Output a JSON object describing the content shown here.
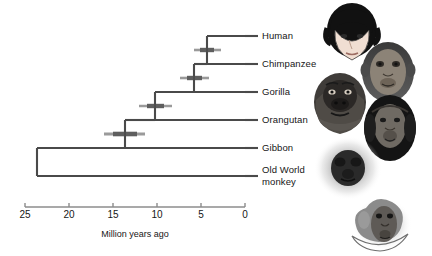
{
  "figure": {
    "type": "phylogenetic-tree",
    "axis_title": "Million years ago",
    "axis": {
      "ticks": [
        25,
        20,
        15,
        10,
        5,
        0
      ],
      "tick_labels": [
        "25",
        "20",
        "15",
        "10",
        "5",
        "0"
      ],
      "min": 0,
      "max": 25,
      "direction": "right-to-left",
      "x_left_px": 25,
      "x_right_px": 245
    },
    "colors": {
      "branch": "#4a4a4a",
      "axis": "#8c8c8c",
      "error_bar": "#8e8e8e",
      "error_bar_core": "#5a5a5a",
      "text": "#161616",
      "background": "#ffffff"
    },
    "tips": [
      {
        "id": "human",
        "label": "Human",
        "row": 0,
        "y_px": 36
      },
      {
        "id": "chimpanzee",
        "label": "Chimpanzee",
        "row": 1,
        "y_px": 64
      },
      {
        "id": "gorilla",
        "label": "Gorilla",
        "row": 2,
        "y_px": 92
      },
      {
        "id": "orangutan",
        "label": "Orangutan",
        "row": 3,
        "y_px": 120
      },
      {
        "id": "gibbon",
        "label": "Gibbon",
        "row": 4,
        "y_px": 148
      },
      {
        "id": "old-world-monkey",
        "label": "Old World",
        "label2": "monkey",
        "row": 5,
        "y_px": 176
      }
    ],
    "nodes": [
      {
        "id": "human-chimp",
        "age_mya": 6.0,
        "x_px": 207,
        "y_px": 50,
        "children": [
          "human",
          "chimpanzee"
        ],
        "ci_low_mya": 7.4,
        "ci_high_mya": 4.6
      },
      {
        "id": "hc-gorilla",
        "age_mya": 7.1,
        "x_px": 194,
        "y_px": 78,
        "children": [
          "human-chimp",
          "gorilla"
        ],
        "ci_low_mya": 8.6,
        "ci_high_mya": 5.6
      },
      {
        "id": "hcg-orangutan",
        "age_mya": 11.6,
        "x_px": 155,
        "y_px": 106,
        "children": [
          "hc-gorilla",
          "orangutan"
        ],
        "ci_low_mya": 13.3,
        "ci_high_mya": 9.9
      },
      {
        "id": "apes-gibbon",
        "age_mya": 15.0,
        "x_px": 125,
        "y_px": 134,
        "children": [
          "hcg-orangutan",
          "gibbon"
        ],
        "ci_low_mya": 17.1,
        "ci_high_mya": 12.9
      },
      {
        "id": "root-owm",
        "age_mya": 23.5,
        "x_px": 50,
        "y_px": 162,
        "children": [
          "apes-gibbon",
          "old-world-monkey"
        ],
        "ci_low_mya": null,
        "ci_high_mya": null
      }
    ],
    "illustrations": [
      {
        "id": "human-face-art",
        "label": "human face illustration"
      },
      {
        "id": "chimpanzee-face-art",
        "label": "chimpanzee face illustration"
      },
      {
        "id": "gorilla-face-art",
        "label": "gorilla face illustration"
      },
      {
        "id": "orangutan-face-art",
        "label": "orangutan face illustration"
      },
      {
        "id": "gibbon-face-art",
        "label": "gibbon face illustration"
      },
      {
        "id": "monkey-face-art",
        "label": "old world monkey face illustration"
      }
    ]
  }
}
